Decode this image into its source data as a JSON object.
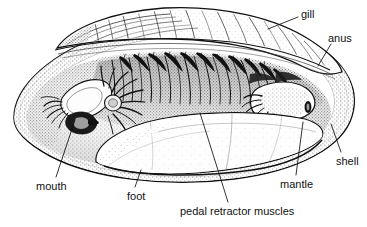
{
  "figure": {
    "type": "scientific-illustration",
    "title": "",
    "style": "pen-and-ink stipple engraving, black on white",
    "background_color": "#ffffff",
    "ink_color": "#111111",
    "width": 367,
    "height": 227
  },
  "labels": [
    {
      "id": "gill",
      "text": "gill",
      "x": 301,
      "y": 8,
      "anchor": "start",
      "leader": {
        "x1": 298,
        "y1": 17,
        "x2": 268,
        "y2": 29
      }
    },
    {
      "id": "anus",
      "text": "anus",
      "x": 328,
      "y": 32,
      "anchor": "start",
      "leader": {
        "x1": 331,
        "y1": 44,
        "x2": 318,
        "y2": 66
      }
    },
    {
      "id": "shell",
      "text": "shell",
      "x": 336,
      "y": 155,
      "anchor": "start",
      "leader": {
        "x1": 341,
        "y1": 152,
        "x2": 331,
        "y2": 124
      }
    },
    {
      "id": "mantle",
      "text": "mantle",
      "x": 280,
      "y": 178,
      "anchor": "start",
      "leader": {
        "x1": 296,
        "y1": 175,
        "x2": 303,
        "y2": 122
      }
    },
    {
      "id": "pedal-retractor-muscles",
      "text": "pedal retractor muscles",
      "x": 180,
      "y": 205,
      "anchor": "start",
      "leader": {
        "x1": 228,
        "y1": 202,
        "x2": 200,
        "y2": 113
      }
    },
    {
      "id": "foot",
      "text": "foot",
      "x": 127,
      "y": 190,
      "anchor": "start",
      "leader": {
        "x1": 135,
        "y1": 187,
        "x2": 141,
        "y2": 170
      }
    },
    {
      "id": "mouth",
      "text": "mouth",
      "x": 36,
      "y": 180,
      "anchor": "start",
      "leader": {
        "x1": 56,
        "y1": 177,
        "x2": 75,
        "y2": 120
      }
    }
  ],
  "structures": [
    {
      "id": "upper-shell-valve",
      "name": "upper shell valve with concentric growth lines"
    },
    {
      "id": "lower-shell-rim",
      "name": "lower shell valve rim"
    },
    {
      "id": "mantle-lobe",
      "name": "mantle lobe, stippled"
    },
    {
      "id": "gill-lamellae",
      "name": "gill filaments / ctenidia"
    },
    {
      "id": "labial-palps",
      "name": "labial palps near mouth"
    },
    {
      "id": "foot-mass",
      "name": "muscular foot, pale wedge"
    },
    {
      "id": "posterior-siphon",
      "name": "posterior siphon and anus region"
    },
    {
      "id": "retractor-muscle-scar",
      "name": "pedal retractor muscle attachment"
    }
  ],
  "colors": {
    "ink": "#111111",
    "mid_gray": "#7a7a7a",
    "light_gray": "#bdbdbd",
    "paper": "#ffffff"
  }
}
